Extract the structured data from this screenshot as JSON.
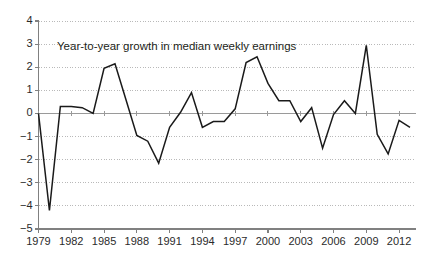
{
  "chart_data": {
    "type": "line",
    "title": "",
    "annotation": "Year-to-year growth in median weekly earnings",
    "xlabel": "",
    "ylabel": "",
    "xlim": [
      1979,
      2013
    ],
    "ylim": [
      -5,
      4
    ],
    "grid": true,
    "legend": false,
    "zero_line": true,
    "y_ticks": [
      4,
      3,
      2,
      1,
      0,
      -1,
      -2,
      -3,
      -4,
      -5
    ],
    "y_tick_labels": [
      "4",
      "3",
      "2",
      "1",
      "0",
      "−1",
      "−2",
      "−3",
      "−4",
      "−5"
    ],
    "x_ticks": [
      1979,
      1982,
      1985,
      1988,
      1991,
      1994,
      1997,
      2000,
      2003,
      2006,
      2009,
      2012
    ],
    "x_tick_labels": [
      "1979",
      "1982",
      "1985",
      "1988",
      "1991",
      "1994",
      "1997",
      "2000",
      "2003",
      "2006",
      "2009",
      "2012"
    ],
    "x": [
      1979,
      1980,
      1981,
      1982,
      1983,
      1984,
      1985,
      1986,
      1987,
      1988,
      1989,
      1990,
      1991,
      1992,
      1993,
      1994,
      1995,
      1996,
      1997,
      1998,
      1999,
      2000,
      2001,
      2002,
      2003,
      2004,
      2005,
      2006,
      2007,
      2008,
      2009,
      2010,
      2011,
      2012,
      2013
    ],
    "values": [
      0.0,
      -4.2,
      0.3,
      0.3,
      0.25,
      0.0,
      1.95,
      2.15,
      0.6,
      -0.95,
      -1.2,
      -2.15,
      -0.6,
      0.05,
      0.9,
      -0.6,
      -0.35,
      -0.35,
      0.2,
      2.2,
      2.45,
      1.3,
      0.55,
      0.55,
      -0.35,
      0.25,
      -1.5,
      -0.05,
      0.55,
      0.0,
      2.95,
      -0.9,
      -1.75,
      -0.3,
      -0.6
    ],
    "series": [
      {
        "name": "Year-to-year growth in median weekly earnings",
        "color": "#1a1a1a",
        "values": [
          0.0,
          -4.2,
          0.3,
          0.3,
          0.25,
          0.0,
          1.95,
          2.15,
          0.6,
          -0.95,
          -1.2,
          -2.15,
          -0.6,
          0.05,
          0.9,
          -0.6,
          -0.35,
          -0.35,
          0.2,
          2.2,
          2.45,
          1.3,
          0.55,
          0.55,
          -0.35,
          0.25,
          -1.5,
          -0.05,
          0.55,
          0.0,
          2.95,
          -0.9,
          -1.75,
          -0.3,
          -0.6
        ]
      }
    ],
    "colors": {
      "line": "#1a1a1a",
      "gridline": "#a8a8a8",
      "axis": "#808080",
      "zero_line": "#9a9a9a",
      "text": "#2b2b2b",
      "background": "#ffffff"
    }
  }
}
